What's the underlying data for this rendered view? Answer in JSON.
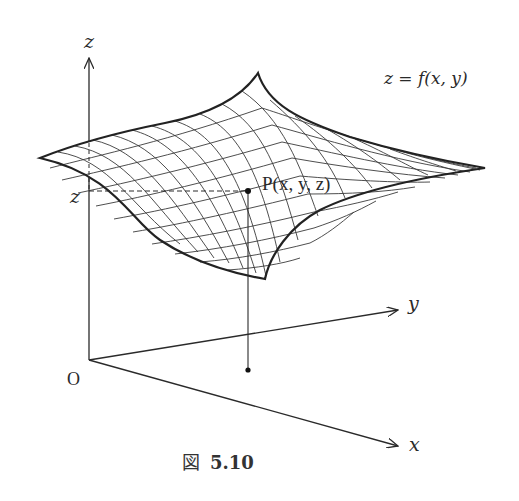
{
  "figure": {
    "caption_prefix": "図",
    "caption_number": "5.10",
    "equation": "z = f(x, y)"
  },
  "axes": {
    "z_label": "z",
    "y_label": "y",
    "x_label": "x",
    "origin_label": "O",
    "z_value_label": "z"
  },
  "point": {
    "label": "P(x, y, z)"
  },
  "colors": {
    "stroke": "#2a2a2a",
    "mesh": "#3a3a3a",
    "background": "#ffffff"
  }
}
